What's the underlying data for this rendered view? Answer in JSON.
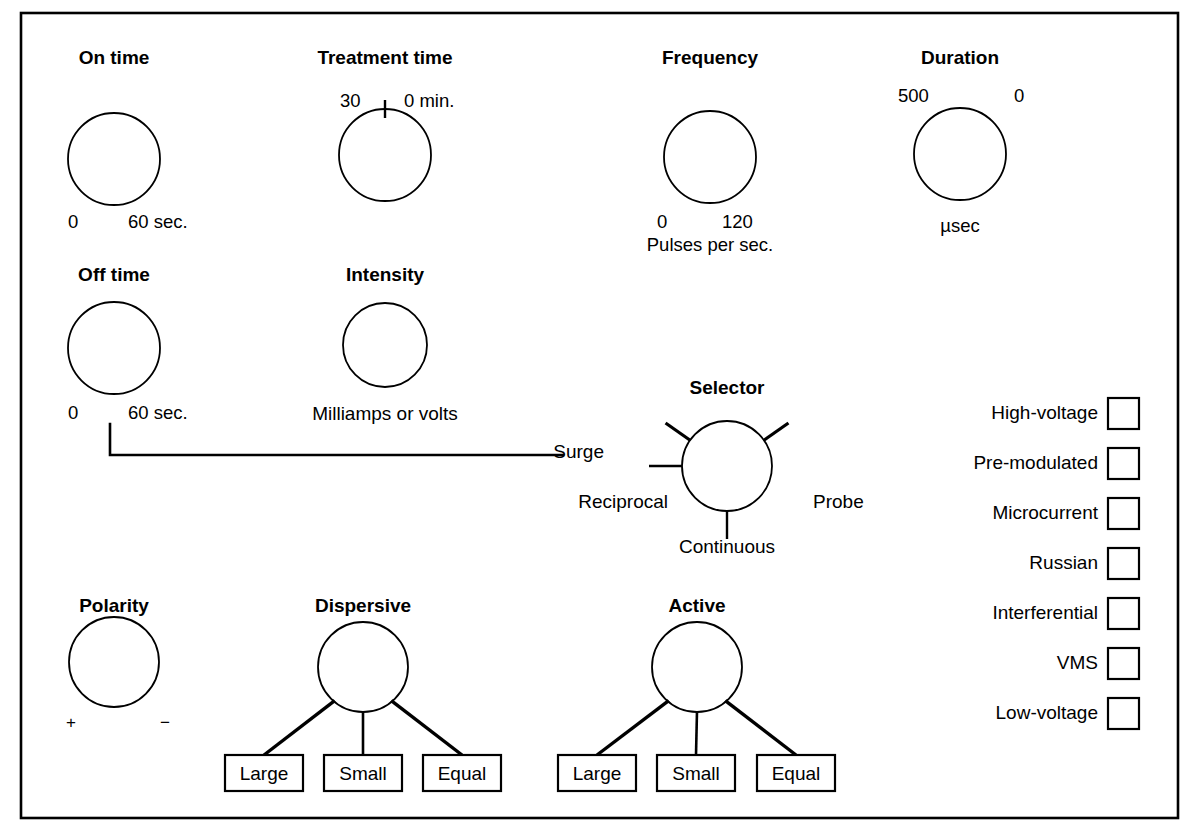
{
  "diagram": {
    "border_color": "#000000",
    "line_color": "#000000",
    "background": "#ffffff"
  },
  "knobs": [
    {
      "id": "on-time",
      "title": "On time",
      "left_scale": "0",
      "right_scale": "60 sec.",
      "cx": 114,
      "cy": 159,
      "r": 46,
      "title_x": 114,
      "title_y": 48,
      "left_x": 68,
      "left_y": 213,
      "right_x": 128,
      "right_y": 213,
      "has_tick": false
    },
    {
      "id": "treatment-time",
      "title": "Treatment time",
      "left_scale": "30",
      "right_scale": "0 min.",
      "cx": 385,
      "cy": 155,
      "r": 46,
      "title_x": 385,
      "title_y": 48,
      "left_x": 340,
      "left_y": 92,
      "right_x": 404,
      "right_y": 92,
      "has_tick": true
    },
    {
      "id": "frequency",
      "title": "Frequency",
      "left_scale": "0",
      "right_scale": "120",
      "cx": 710,
      "cy": 157,
      "r": 46,
      "title_x": 710,
      "title_y": 48,
      "left_x": 657,
      "left_y": 213,
      "right_x": 722,
      "right_y": 213,
      "has_tick": false
    },
    {
      "id": "duration",
      "title": "Duration",
      "left_scale": "500",
      "right_scale": "0",
      "cx": 960,
      "cy": 154,
      "r": 46,
      "title_x": 960,
      "title_y": 48,
      "left_x": 898,
      "left_y": 87,
      "right_x": 1014,
      "right_y": 87,
      "has_tick": false
    },
    {
      "id": "off-time",
      "title": "Off time",
      "left_scale": "0",
      "right_scale": "60 sec.",
      "cx": 114,
      "cy": 348,
      "r": 46,
      "title_x": 114,
      "title_y": 265,
      "left_x": 68,
      "left_y": 404,
      "right_x": 128,
      "right_y": 404,
      "has_tick": false
    },
    {
      "id": "intensity",
      "title": "Intensity",
      "left_scale": "",
      "right_scale": "",
      "cx": 385,
      "cy": 345,
      "r": 42,
      "title_x": 385,
      "title_y": 265,
      "left_x": 0,
      "left_y": 0,
      "right_x": 0,
      "right_y": 0,
      "has_tick": false
    },
    {
      "id": "polarity",
      "title": "Polarity",
      "left_scale": "+",
      "right_scale": "−",
      "cx": 114,
      "cy": 662,
      "r": 45,
      "title_x": 114,
      "title_y": 596,
      "left_x": 66,
      "left_y": 714,
      "right_x": 160,
      "right_y": 714,
      "has_tick": false
    }
  ],
  "units": {
    "frequency_unit": "Pulses per sec.",
    "frequency_unit_x": 710,
    "frequency_unit_y": 236,
    "duration_unit": "µsec",
    "duration_unit_x": 960,
    "duration_unit_y": 217,
    "intensity_unit": "Milliamps or volts",
    "intensity_unit_x": 385,
    "intensity_unit_y": 404
  },
  "selector": {
    "title": "Selector",
    "title_x": 727,
    "title_y": 378,
    "cx": 727,
    "cy": 466,
    "r": 45,
    "options": [
      {
        "label": "Surge",
        "x": 604,
        "y": 442,
        "align": "right",
        "angle": 180
      },
      {
        "label": "Reciprocal",
        "x": 668,
        "y": 492,
        "align": "right",
        "angle": 215
      },
      {
        "label": "Continuous",
        "x": 727,
        "y": 537,
        "align": "center",
        "angle": 90
      },
      {
        "label": "Probe",
        "x": 813,
        "y": 492,
        "align": "left",
        "angle": 325
      }
    ]
  },
  "surge_connector": {
    "from_x": 110,
    "from_y": 424,
    "corner_y": 455,
    "to_x": 563
  },
  "modes": {
    "items": [
      {
        "label": "High-voltage",
        "checked": false
      },
      {
        "label": "Pre-modulated",
        "checked": false
      },
      {
        "label": "Microcurrent",
        "checked": false
      },
      {
        "label": "Russian",
        "checked": false
      },
      {
        "label": "Interferential",
        "checked": false
      },
      {
        "label": "VMS",
        "checked": false
      },
      {
        "label": "Low-voltage",
        "checked": false
      }
    ],
    "label_right_x": 1098,
    "box_x": 1108,
    "box_size": 31,
    "first_y": 398,
    "row_step": 50
  },
  "electrode_groups": [
    {
      "id": "dispersive",
      "title": "Dispersive",
      "title_x": 363,
      "title_y": 596,
      "cx": 363,
      "cy": 667,
      "r": 45,
      "boxes": [
        {
          "label": "Large",
          "x": 225,
          "y": 755,
          "w": 78,
          "h": 36
        },
        {
          "label": "Small",
          "x": 324,
          "y": 755,
          "w": 78,
          "h": 36
        },
        {
          "label": "Equal",
          "x": 423,
          "y": 755,
          "w": 78,
          "h": 36
        }
      ]
    },
    {
      "id": "active",
      "title": "Active",
      "title_x": 697,
      "title_y": 596,
      "cx": 697,
      "cy": 667,
      "r": 45,
      "boxes": [
        {
          "label": "Large",
          "x": 558,
          "y": 755,
          "w": 78,
          "h": 36
        },
        {
          "label": "Small",
          "x": 657,
          "y": 755,
          "w": 78,
          "h": 36
        },
        {
          "label": "Equal",
          "x": 757,
          "y": 755,
          "w": 78,
          "h": 36
        }
      ]
    }
  ],
  "frame": {
    "x": 21,
    "y": 13,
    "w": 1157,
    "h": 805
  }
}
